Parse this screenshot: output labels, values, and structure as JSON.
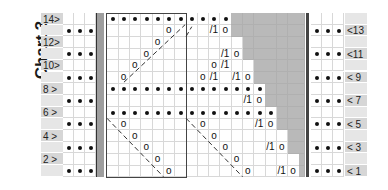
{
  "title": "Chart 3",
  "chart_data": {
    "type": "table",
    "title": "Chart 3",
    "rows": 14,
    "left_labels": [
      {
        "row": 14,
        "text": "14>"
      },
      {
        "row": 12,
        "text": "12>"
      },
      {
        "row": 10,
        "text": "10>"
      },
      {
        "row": 8,
        "text": "8 >"
      },
      {
        "row": 6,
        "text": "6 >"
      },
      {
        "row": 4,
        "text": "4 >"
      },
      {
        "row": 2,
        "text": "2 >"
      }
    ],
    "right_labels": [
      {
        "row": 13,
        "text": "<13"
      },
      {
        "row": 11,
        "text": "<11"
      },
      {
        "row": 9,
        "text": "< 9"
      },
      {
        "row": 7,
        "text": "< 7"
      },
      {
        "row": 5,
        "text": "< 5"
      },
      {
        "row": 3,
        "text": "< 3"
      },
      {
        "row": 1,
        "text": "< 1"
      }
    ],
    "side_dot_rows": [
      13,
      11,
      9,
      7,
      5,
      3,
      1
    ],
    "main_columns": 17,
    "white_extent_by_row": {
      "1": 16,
      "2": 16,
      "3": 15,
      "4": 15,
      "5": 14,
      "6": 14,
      "7": 13,
      "8": 13,
      "9": 12,
      "10": 12,
      "11": 11,
      "12": 11,
      "13": 10,
      "14": 10
    },
    "purl_rows": [
      {
        "row": 14,
        "from": 0,
        "to": 10
      },
      {
        "row": 8,
        "from": 0,
        "to": 13
      },
      {
        "row": 6,
        "from": 0,
        "to": 14
      }
    ],
    "yarn_overs": [
      {
        "row": 9,
        "col": 1
      },
      {
        "row": 10,
        "col": 2
      },
      {
        "row": 11,
        "col": 3
      },
      {
        "row": 12,
        "col": 4
      },
      {
        "row": 13,
        "col": 5
      },
      {
        "row": 5,
        "col": 1
      },
      {
        "row": 4,
        "col": 2
      },
      {
        "row": 3,
        "col": 3
      },
      {
        "row": 2,
        "col": 4
      },
      {
        "row": 1,
        "col": 5
      },
      {
        "row": 9,
        "col": 8
      },
      {
        "row": 10,
        "col": 9
      },
      {
        "row": 5,
        "col": 8
      },
      {
        "row": 4,
        "col": 9
      },
      {
        "row": 3,
        "col": 10
      },
      {
        "row": 2,
        "col": 11
      },
      {
        "row": 1,
        "col": 12
      },
      {
        "row": 13,
        "col": 10
      },
      {
        "row": 11,
        "col": 11
      },
      {
        "row": 9,
        "col": 12
      },
      {
        "row": 7,
        "col": 13
      },
      {
        "row": 5,
        "col": 14
      },
      {
        "row": 3,
        "col": 15
      },
      {
        "row": 1,
        "col": 16
      }
    ],
    "k2tog": [
      {
        "row": 10,
        "col": 10
      },
      {
        "row": 9,
        "col": 9
      },
      {
        "row": 13,
        "col": 9
      },
      {
        "row": 11,
        "col": 10
      },
      {
        "row": 9,
        "col": 11
      },
      {
        "row": 7,
        "col": 12
      },
      {
        "row": 5,
        "col": 13
      },
      {
        "row": 3,
        "col": 14
      },
      {
        "row": 1,
        "col": 15
      }
    ],
    "symbols": {
      "purl": "•",
      "yarn_over": "o",
      "k2tog": "/1"
    }
  }
}
